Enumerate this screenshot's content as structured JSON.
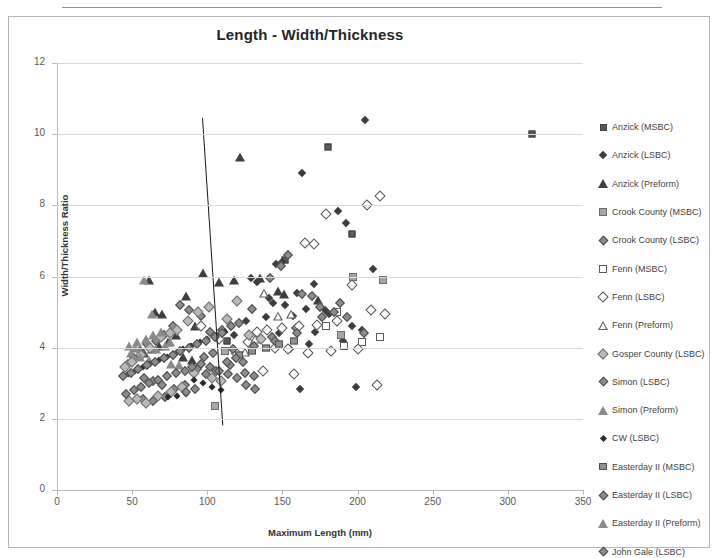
{
  "chart_data": {
    "type": "scatter",
    "title": "Length - Width/Thickness",
    "xlabel": "Maximum Length (mm)",
    "ylabel": "Width/Thickness Ratio",
    "xlim": [
      0,
      350
    ],
    "ylim": [
      0,
      12
    ],
    "xticks": [
      0,
      50,
      100,
      150,
      200,
      250,
      300,
      350
    ],
    "yticks": [
      0,
      2,
      4,
      6,
      8,
      10,
      12
    ],
    "grid": "horizontal",
    "legend_position": "right",
    "annotations": [
      {
        "type": "line",
        "name": "trend-line",
        "x1": 97,
        "y1": 10.45,
        "x2": 110.5,
        "y2": 1.8
      }
    ],
    "series": [
      {
        "name": "Anzick (MSBC)",
        "marker": "sq-filled",
        "points": [
          [
            316,
            10.0
          ],
          [
            180,
            9.65
          ],
          [
            196,
            7.2
          ],
          [
            152,
            6.45
          ],
          [
            113,
            4.2
          ]
        ]
      },
      {
        "name": "Anzick (LSBC)",
        "marker": "di-filled",
        "points": [
          [
            205,
            10.4
          ],
          [
            163,
            8.9
          ],
          [
            187,
            7.85
          ],
          [
            192,
            7.5
          ],
          [
            210,
            6.2
          ],
          [
            150,
            6.4
          ],
          [
            146,
            6.35
          ],
          [
            129,
            5.95
          ],
          [
            133,
            5.85
          ],
          [
            171,
            5.8
          ],
          [
            160,
            5.55
          ],
          [
            141,
            5.4
          ],
          [
            144,
            5.25
          ],
          [
            152,
            5.2
          ],
          [
            166,
            5.1
          ],
          [
            178,
            5.05
          ],
          [
            181,
            4.95
          ],
          [
            157,
            4.9
          ],
          [
            139,
            4.85
          ],
          [
            126,
            4.75
          ],
          [
            196,
            4.6
          ],
          [
            203,
            4.5
          ],
          [
            172,
            4.45
          ],
          [
            148,
            4.4
          ],
          [
            118,
            4.35
          ],
          [
            190,
            4.2
          ],
          [
            168,
            4.1
          ],
          [
            155,
            3.95
          ],
          [
            183,
            3.9
          ],
          [
            199,
            2.9
          ],
          [
            162,
            2.85
          ]
        ]
      },
      {
        "name": "Anzick (Preform)",
        "marker": "tri-filled",
        "points": [
          [
            122,
            9.35
          ],
          [
            61,
            5.9
          ],
          [
            97,
            6.1
          ],
          [
            65,
            5.0
          ],
          [
            70,
            4.95
          ],
          [
            86,
            5.45
          ],
          [
            92,
            4.6
          ],
          [
            108,
            5.85
          ],
          [
            118,
            5.9
          ],
          [
            135,
            5.95
          ],
          [
            147,
            5.6
          ],
          [
            151,
            5.5
          ],
          [
            174,
            5.35
          ],
          [
            79,
            4.35
          ],
          [
            74,
            4.15
          ],
          [
            68,
            4.05
          ],
          [
            63,
            3.95
          ],
          [
            58,
            3.85
          ],
          [
            84,
            3.75
          ],
          [
            90,
            3.65
          ]
        ]
      },
      {
        "name": "Crook County (MSBC)",
        "marker": "sq-gray",
        "points": [
          [
            217,
            5.9
          ],
          [
            197,
            6.0
          ],
          [
            189,
            4.35
          ],
          [
            105,
            2.35
          ],
          [
            112,
            3.9
          ]
        ]
      },
      {
        "name": "Crook County (LSBC)",
        "marker": "di-gray",
        "points": [
          [
            188,
            5.25
          ],
          [
            176,
            4.85
          ],
          [
            204,
            4.4
          ],
          [
            159,
            4.55
          ],
          [
            143,
            4.3
          ],
          [
            130,
            5.1
          ],
          [
            121,
            4.7
          ],
          [
            110,
            4.5
          ],
          [
            102,
            4.45
          ],
          [
            96,
            4.9
          ],
          [
            88,
            5.05
          ],
          [
            82,
            5.2
          ],
          [
            77,
            4.6
          ],
          [
            71,
            4.35
          ],
          [
            66,
            4.2
          ],
          [
            60,
            4.1
          ],
          [
            55,
            3.9
          ],
          [
            51,
            3.7
          ],
          [
            47,
            3.55
          ],
          [
            93,
            3.4
          ],
          [
            99,
            3.25
          ],
          [
            106,
            3.35
          ],
          [
            115,
            3.5
          ],
          [
            124,
            3.6
          ],
          [
            85,
            2.95
          ],
          [
            78,
            2.85
          ],
          [
            72,
            2.6
          ],
          [
            64,
            2.5
          ],
          [
            57,
            2.55
          ]
        ]
      },
      {
        "name": "Fenn (MSBC)",
        "marker": "sq-open",
        "points": [
          [
            203,
            4.15
          ],
          [
            215,
            4.3
          ],
          [
            191,
            4.05
          ],
          [
            179,
            4.6
          ],
          [
            186,
            5.0
          ]
        ]
      },
      {
        "name": "Fenn (LSBC)",
        "marker": "di-open",
        "points": [
          [
            215,
            8.25
          ],
          [
            206,
            8.0
          ],
          [
            179,
            7.75
          ],
          [
            165,
            6.95
          ],
          [
            171,
            6.9
          ],
          [
            196,
            5.75
          ],
          [
            209,
            5.05
          ],
          [
            218,
            4.95
          ],
          [
            186,
            4.75
          ],
          [
            173,
            4.65
          ],
          [
            161,
            4.6
          ],
          [
            150,
            4.55
          ],
          [
            140,
            4.5
          ],
          [
            133,
            4.45
          ],
          [
            127,
            4.15
          ],
          [
            145,
            4.0
          ],
          [
            154,
            3.95
          ],
          [
            167,
            3.85
          ],
          [
            182,
            3.9
          ],
          [
            200,
            3.95
          ],
          [
            213,
            2.95
          ],
          [
            158,
            3.25
          ],
          [
            137,
            3.35
          ],
          [
            119,
            3.85
          ],
          [
            108,
            4.25
          ],
          [
            96,
            4.6
          ]
        ]
      },
      {
        "name": "Fenn (Preform)",
        "marker": "tri-open",
        "points": [
          [
            138,
            5.55
          ],
          [
            156,
            5.2
          ],
          [
            147,
            5.4
          ],
          [
            132,
            5.0
          ],
          [
            125,
            4.9
          ]
        ]
      },
      {
        "name": "Gosper County (LSBC)",
        "marker": "di-gray-lt",
        "points": [
          [
            101,
            5.15
          ],
          [
            94,
            5.0
          ],
          [
            113,
            4.8
          ],
          [
            120,
            5.3
          ],
          [
            87,
            4.75
          ],
          [
            80,
            4.5
          ],
          [
            75,
            4.4
          ],
          [
            69,
            4.3
          ],
          [
            62,
            4.0
          ],
          [
            56,
            3.8
          ],
          [
            50,
            3.6
          ],
          [
            45,
            3.45
          ],
          [
            91,
            3.3
          ],
          [
            103,
            3.15
          ],
          [
            109,
            3.05
          ],
          [
            83,
            2.9
          ],
          [
            76,
            2.75
          ],
          [
            67,
            2.65
          ],
          [
            59,
            2.45
          ],
          [
            53,
            2.55
          ],
          [
            48,
            2.5
          ],
          [
            128,
            4.35
          ],
          [
            136,
            4.25
          ]
        ]
      },
      {
        "name": "Simon (LSBC)",
        "marker": "di-gray",
        "points": [
          [
            154,
            6.6
          ],
          [
            149,
            6.3
          ],
          [
            142,
            5.95
          ],
          [
            163,
            5.5
          ],
          [
            170,
            5.45
          ],
          [
            175,
            5.15
          ],
          [
            184,
            5.0
          ],
          [
            193,
            4.85
          ],
          [
            160,
            4.4
          ],
          [
            145,
            4.2
          ],
          [
            131,
            4.05
          ],
          [
            117,
            3.95
          ],
          [
            104,
            3.85
          ],
          [
            98,
            3.75
          ]
        ]
      },
      {
        "name": "Simon (Preform)",
        "marker": "tri-gray",
        "points": [
          [
            58,
            5.9
          ],
          [
            63,
            4.95
          ],
          [
            52,
            4.0
          ],
          [
            66,
            3.95
          ],
          [
            72,
            4.05
          ],
          [
            49,
            3.85
          ],
          [
            55,
            3.75
          ],
          [
            61,
            3.65
          ],
          [
            76,
            3.55
          ],
          [
            81,
            3.5
          ]
        ]
      },
      {
        "name": "CW (LSBC)",
        "marker": "di-filled-sm",
        "points": [
          [
            112,
            4.45
          ],
          [
            106,
            4.35
          ],
          [
            100,
            4.25
          ],
          [
            95,
            4.15
          ],
          [
            89,
            4.05
          ],
          [
            84,
            3.95
          ],
          [
            79,
            3.85
          ],
          [
            73,
            3.75
          ],
          [
            68,
            3.65
          ],
          [
            62,
            3.55
          ],
          [
            57,
            3.45
          ],
          [
            52,
            3.35
          ],
          [
            47,
            3.25
          ],
          [
            91,
            3.1
          ],
          [
            97,
            3.0
          ],
          [
            103,
            2.9
          ],
          [
            109,
            2.8
          ],
          [
            86,
            2.7
          ],
          [
            80,
            2.65
          ],
          [
            74,
            2.6
          ]
        ]
      },
      {
        "name": "Easterday II (MSBC)",
        "marker": "sq-gray2",
        "points": [
          [
            148,
            4.1
          ],
          [
            158,
            4.2
          ],
          [
            139,
            4.0
          ],
          [
            130,
            3.9
          ],
          [
            121,
            3.8
          ]
        ]
      },
      {
        "name": "Easterday II (LSBC)",
        "marker": "di-gray",
        "points": [
          [
            116,
            4.6
          ],
          [
            110,
            4.4
          ],
          [
            105,
            4.3
          ],
          [
            99,
            4.2
          ],
          [
            93,
            4.1
          ],
          [
            88,
            4.0
          ],
          [
            82,
            3.9
          ],
          [
            77,
            3.8
          ],
          [
            71,
            3.7
          ],
          [
            65,
            3.6
          ],
          [
            60,
            3.5
          ],
          [
            54,
            3.4
          ],
          [
            49,
            3.3
          ],
          [
            44,
            3.2
          ],
          [
            92,
            2.85
          ],
          [
            86,
            2.75
          ],
          [
            70,
            2.95
          ],
          [
            64,
            3.05
          ],
          [
            58,
            3.15
          ],
          [
            113,
            3.6
          ],
          [
            119,
            3.7
          ],
          [
            125,
            3.3
          ],
          [
            131,
            3.2
          ]
        ]
      },
      {
        "name": "Easterday II (Preform)",
        "marker": "tri-gray",
        "points": [
          [
            59,
            4.25
          ],
          [
            53,
            4.15
          ],
          [
            64,
            4.35
          ],
          [
            69,
            4.45
          ],
          [
            75,
            4.15
          ],
          [
            48,
            4.05
          ]
        ]
      },
      {
        "name": "John Gale (LSBC)",
        "marker": "di-gray",
        "points": [
          [
            96,
            3.55
          ],
          [
            90,
            3.45
          ],
          [
            85,
            3.35
          ],
          [
            79,
            3.3
          ],
          [
            73,
            3.2
          ],
          [
            67,
            3.1
          ],
          [
            61,
            3.0
          ],
          [
            56,
            2.9
          ],
          [
            51,
            2.8
          ],
          [
            46,
            2.7
          ],
          [
            102,
            3.45
          ],
          [
            108,
            3.35
          ],
          [
            114,
            3.25
          ],
          [
            120,
            3.15
          ],
          [
            126,
            2.95
          ],
          [
            132,
            2.85
          ]
        ]
      }
    ]
  },
  "legend": {
    "items": [
      {
        "label": "Anzick (MSBC)",
        "marker": "sq-filled"
      },
      {
        "label": "Anzick (LSBC)",
        "marker": "di-filled"
      },
      {
        "label": "Anzick (Preform)",
        "marker": "tri-filled"
      },
      {
        "label": "Crook County (MSBC)",
        "marker": "sq-gray"
      },
      {
        "label": "Crook County (LSBC)",
        "marker": "di-gray"
      },
      {
        "label": "Fenn (MSBC)",
        "marker": "sq-open"
      },
      {
        "label": "Fenn (LSBC)",
        "marker": "di-open"
      },
      {
        "label": "Fenn (Preform)",
        "marker": "tri-open"
      },
      {
        "label": "Gosper County (LSBC)",
        "marker": "di-gray-lt"
      },
      {
        "label": "Simon (LSBC)",
        "marker": "di-gray"
      },
      {
        "label": "Simon (Preform)",
        "marker": "tri-gray"
      },
      {
        "label": "CW (LSBC)",
        "marker": "di-filled-sm"
      },
      {
        "label": "Easterday II (MSBC)",
        "marker": "sq-gray2"
      },
      {
        "label": "Easterday II (LSBC)",
        "marker": "di-gray"
      },
      {
        "label": "Easterday II (Preform)",
        "marker": "tri-gray"
      },
      {
        "label": "John Gale (LSBC)",
        "marker": "di-gray"
      }
    ]
  }
}
